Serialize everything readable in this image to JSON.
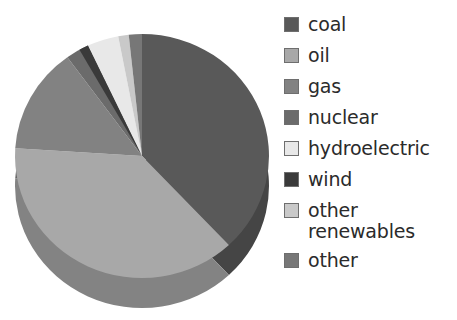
{
  "chart_data": {
    "type": "pie",
    "title": "",
    "subtitle": "",
    "xlabel": "",
    "ylabel": "",
    "grid": false,
    "legend_position": "right",
    "style": "3d-pie",
    "start_angle_deg": 0,
    "direction": "clockwise",
    "categories": [
      "coal",
      "oil",
      "gas",
      "nuclear",
      "hydroelectric",
      "wind",
      "other renewables",
      "other"
    ],
    "values": [
      38,
      38,
      14,
      3,
      4,
      1.2,
      1.3,
      0.5
    ],
    "unit": "percent",
    "colors": [
      "#595959",
      "#a8a8a8",
      "#828282",
      "#6b6b6b",
      "#e8e8e8",
      "#3a3a3a",
      "#c9c9c9",
      "#777777"
    ],
    "slices": [
      {
        "label": "coal",
        "value": 38,
        "color": "#595959",
        "start_deg": 0,
        "end_deg": 136.8
      },
      {
        "label": "oil",
        "value": 38,
        "color": "#a8a8a8",
        "start_deg": 136.8,
        "end_deg": 273.6
      },
      {
        "label": "gas",
        "value": 14,
        "color": "#828282",
        "start_deg": 273.6,
        "end_deg": 324.0
      },
      {
        "label": "nuclear",
        "value": 3,
        "color": "#6b6b6b",
        "start_deg": 324.0,
        "end_deg": 334.8
      },
      {
        "label": "hydroelectric",
        "value": 4,
        "color": "#e8e8e8",
        "start_deg": 334.8,
        "end_deg": 349.2
      },
      {
        "label": "wind",
        "value": 1.2,
        "color": "#3a3a3a",
        "start_deg": 330.5,
        "end_deg": 334.8
      },
      {
        "label": "other renewables",
        "value": 1.3,
        "color": "#c9c9c9",
        "start_deg": 349.2,
        "end_deg": 354.0
      },
      {
        "label": "other",
        "value": 0.5,
        "color": "#777777",
        "start_deg": 354.0,
        "end_deg": 360.0
      }
    ]
  },
  "legend": {
    "items": [
      {
        "label": "coal",
        "color": "#595959"
      },
      {
        "label": "oil",
        "color": "#a8a8a8"
      },
      {
        "label": "gas",
        "color": "#828282"
      },
      {
        "label": "nuclear",
        "color": "#6b6b6b"
      },
      {
        "label": "hydroelectric",
        "color": "#e8e8e8"
      },
      {
        "label": "wind",
        "color": "#3a3a3a"
      },
      {
        "label": "other\nrenewables",
        "color": "#c9c9c9"
      },
      {
        "label": "other",
        "color": "#777777"
      }
    ]
  }
}
